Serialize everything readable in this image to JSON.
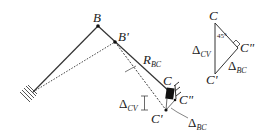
{
  "diagram": {
    "type": "structural-displacement-diagram",
    "main_figure": {
      "labels": {
        "B": "B",
        "B_prime": "B'",
        "R_main": "R",
        "R_sub": "BC",
        "C": "C",
        "C_prime": "C'",
        "C_double_prime": "C\"",
        "delta_cv_sym": "Δ",
        "delta_cv_sub": "CV",
        "delta_bc_sym": "Δ",
        "delta_bc_sub": "BC"
      }
    },
    "triangle_figure": {
      "labels": {
        "C": "C",
        "C_prime": "C'",
        "C_double_prime": "C\"",
        "angle": "45°",
        "delta_cv_sym": "Δ",
        "delta_cv_sub": "CV",
        "delta_bc_sym": "Δ",
        "delta_bc_sub": "BC"
      }
    },
    "colors": {
      "line": "#333333",
      "text": "#222222",
      "background": "#ffffff"
    }
  }
}
